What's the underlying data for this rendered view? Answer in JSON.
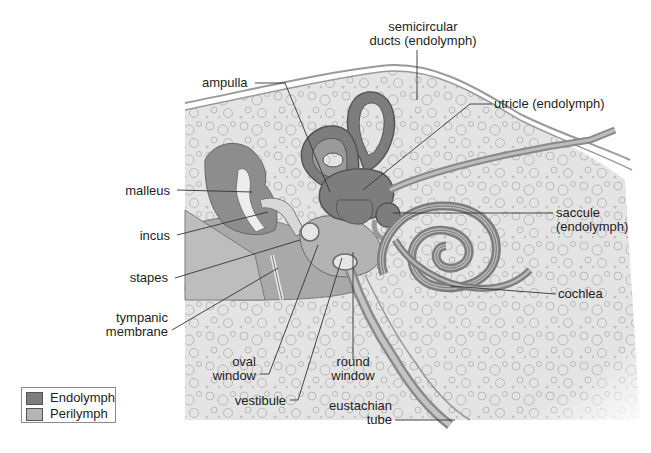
{
  "diagram": {
    "colors": {
      "endolymph": "#7d7d7d",
      "perilymph": "#b4b4b4",
      "bone": "#e3e3e3",
      "bubble": "#c9c9c9",
      "outline": "#5a5a5a",
      "leader": "#333333"
    },
    "labels": {
      "semicircular_line1": "semicircular",
      "semicircular_line2": "ducts (endolymph)",
      "ampulla": "ampulla",
      "utricle": "utricle (endolymph)",
      "malleus": "malleus",
      "incus": "incus",
      "saccule_line1": "saccule",
      "saccule_line2": "(endolymph)",
      "stapes": "stapes",
      "cochlea": "cochlea",
      "tympanic_line1": "tympanic",
      "tympanic_line2": "membrane",
      "oval_line1": "oval",
      "oval_line2": "window",
      "round_line1": "round",
      "round_line2": "window",
      "vestibule": "vestibule",
      "eustachian_line1": "eustachian",
      "eustachian_line2": "tube"
    },
    "legend": {
      "items": [
        {
          "label": "Endolymph",
          "color": "#7d7d7d"
        },
        {
          "label": "Perilymph",
          "color": "#b4b4b4"
        }
      ]
    }
  }
}
